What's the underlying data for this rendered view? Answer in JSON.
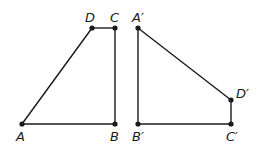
{
  "diagram": {
    "figures": [
      {
        "name": "ABCD",
        "points": [
          {
            "id": "A",
            "label": "A",
            "x": 22,
            "y": 124,
            "lx": 16,
            "ly": 141
          },
          {
            "id": "B",
            "label": "B",
            "x": 115,
            "y": 124,
            "lx": 110,
            "ly": 141
          },
          {
            "id": "C",
            "label": "C",
            "x": 115,
            "y": 28,
            "lx": 110,
            "ly": 22
          },
          {
            "id": "D",
            "label": "D",
            "x": 92,
            "y": 28,
            "lx": 85,
            "ly": 22
          }
        ],
        "edges": [
          [
            "A",
            "B"
          ],
          [
            "B",
            "C"
          ],
          [
            "C",
            "D"
          ],
          [
            "D",
            "A"
          ]
        ]
      },
      {
        "name": "A'B'C'D'",
        "points": [
          {
            "id": "A'",
            "label": "A′",
            "x": 138,
            "y": 28,
            "lx": 132,
            "ly": 22
          },
          {
            "id": "B'",
            "label": "B′",
            "x": 138,
            "y": 124,
            "lx": 132,
            "ly": 141
          },
          {
            "id": "C'",
            "label": "C′",
            "x": 231,
            "y": 124,
            "lx": 226,
            "ly": 141
          },
          {
            "id": "D'",
            "label": "D′",
            "x": 231,
            "y": 100,
            "lx": 236,
            "ly": 98
          }
        ],
        "edges": [
          [
            "A'",
            "B'"
          ],
          [
            "B'",
            "C'"
          ],
          [
            "C'",
            "D'"
          ],
          [
            "D'",
            "A'"
          ]
        ]
      }
    ]
  }
}
